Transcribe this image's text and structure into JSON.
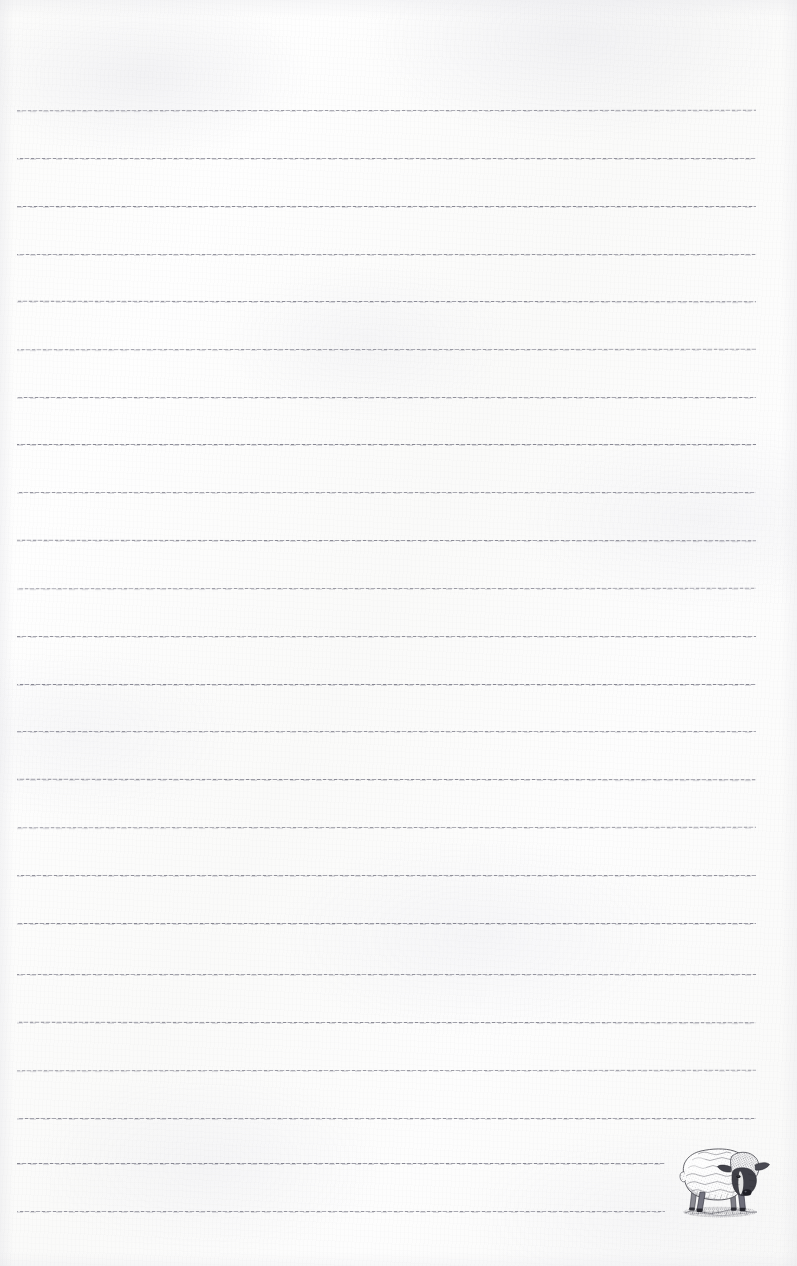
{
  "document": {
    "type": "ruled-notepad-page",
    "title": "Lined notepad page with sheep engraving",
    "paper_color": "#fdfdfc",
    "page_width": 797,
    "page_height": 1266
  },
  "rules": {
    "name": "ruled-lines",
    "count": 24,
    "color": "#6b6b78",
    "line_left": 17,
    "line_right": 756,
    "thickness": 1,
    "style": "dashed-textured",
    "positions": [
      110,
      158,
      206,
      254,
      302,
      350,
      397,
      443,
      491,
      540,
      588,
      612,
      636,
      684,
      731,
      755,
      802,
      850,
      898,
      946,
      1022,
      1070,
      1118,
      1162,
      1210
    ],
    "lines": [
      {
        "y": 110,
        "left": 17,
        "right": 756,
        "content": ""
      },
      {
        "y": 158,
        "left": 17,
        "right": 756,
        "content": ""
      },
      {
        "y": 206,
        "left": 17,
        "right": 756,
        "content": ""
      },
      {
        "y": 254,
        "left": 17,
        "right": 756,
        "content": ""
      },
      {
        "y": 301,
        "left": 17,
        "right": 756,
        "content": ""
      },
      {
        "y": 349,
        "left": 17,
        "right": 756,
        "content": ""
      },
      {
        "y": 397,
        "left": 17,
        "right": 756,
        "content": ""
      },
      {
        "y": 444,
        "left": 17,
        "right": 756,
        "content": ""
      },
      {
        "y": 492,
        "left": 17,
        "right": 756,
        "content": ""
      },
      {
        "y": 540,
        "left": 17,
        "right": 756,
        "content": ""
      },
      {
        "y": 588,
        "left": 17,
        "right": 756,
        "content": ""
      },
      {
        "y": 636,
        "left": 17,
        "right": 756,
        "content": ""
      },
      {
        "y": 684,
        "left": 17,
        "right": 756,
        "content": ""
      },
      {
        "y": 731,
        "left": 17,
        "right": 756,
        "content": ""
      },
      {
        "y": 779,
        "left": 17,
        "right": 756,
        "content": ""
      },
      {
        "y": 827,
        "left": 17,
        "right": 756,
        "content": ""
      },
      {
        "y": 875,
        "left": 17,
        "right": 756,
        "content": ""
      },
      {
        "y": 923,
        "left": 17,
        "right": 756,
        "content": ""
      },
      {
        "y": 974,
        "left": 17,
        "right": 756,
        "content": ""
      },
      {
        "y": 1022,
        "left": 17,
        "right": 756,
        "content": ""
      },
      {
        "y": 1070,
        "left": 17,
        "right": 756,
        "content": ""
      },
      {
        "y": 1118,
        "left": 17,
        "right": 756,
        "content": ""
      },
      {
        "y": 1163,
        "left": 17,
        "right": 665,
        "content": ""
      },
      {
        "y": 1211,
        "left": 17,
        "right": 665,
        "content": ""
      }
    ]
  },
  "illustration": {
    "name": "sheep-illustration",
    "subject": "sheep",
    "style": "vintage engraving",
    "ink_color": "#3a3a3e",
    "x": 668,
    "y": 1134,
    "width": 104,
    "height": 88,
    "caption": ""
  }
}
